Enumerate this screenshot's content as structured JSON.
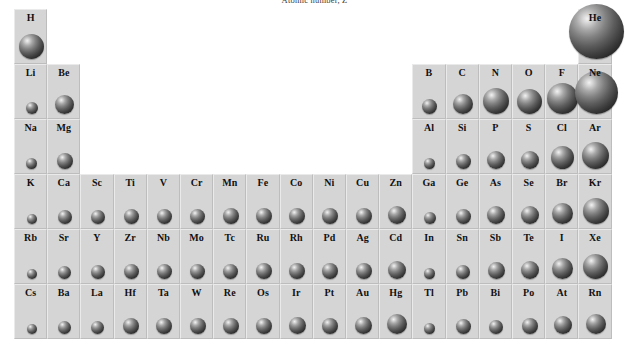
{
  "caption": {
    "text": "Atomic number, Z"
  },
  "colors": {
    "cell_background": "#d5d5d5",
    "cell_border_light": "#eaeaea",
    "cell_border_dark": "#bdbdbd",
    "symbol_text": "#111111",
    "sphere_dark": "#171717",
    "sphere_highlight": "#f2f2f2",
    "page_background": "#ffffff"
  },
  "grid": {
    "groups": 18,
    "periods": 6,
    "cell_width": 33.2,
    "cell_height": 55,
    "origin_x": 0,
    "origin_y": 0
  },
  "chart_data": {
    "type": "table",
    "title": "Atomic number, Z",
    "xlabel": "Group",
    "ylabel": "Period",
    "legend": [],
    "grid_on": true,
    "columns": [
      1,
      2,
      3,
      4,
      5,
      6,
      7,
      8,
      9,
      10,
      11,
      12,
      13,
      14,
      15,
      16,
      17,
      18
    ],
    "rows": [
      "1",
      "2",
      "3",
      "4",
      "5",
      "6"
    ],
    "elements": [
      {
        "symbol": "H",
        "group": 1,
        "period": 1,
        "size": 25
      },
      {
        "symbol": "He",
        "group": 18,
        "period": 1,
        "size": 55
      },
      {
        "symbol": "Li",
        "group": 1,
        "period": 2,
        "size": 12
      },
      {
        "symbol": "Be",
        "group": 2,
        "period": 2,
        "size": 19
      },
      {
        "symbol": "B",
        "group": 13,
        "period": 2,
        "size": 15
      },
      {
        "symbol": "C",
        "group": 14,
        "period": 2,
        "size": 20
      },
      {
        "symbol": "N",
        "group": 15,
        "period": 2,
        "size": 26
      },
      {
        "symbol": "O",
        "group": 16,
        "period": 2,
        "size": 25
      },
      {
        "symbol": "F",
        "group": 17,
        "period": 2,
        "size": 31
      },
      {
        "symbol": "Ne",
        "group": 18,
        "period": 2,
        "size": 43
      },
      {
        "symbol": "Na",
        "group": 1,
        "period": 3,
        "size": 11
      },
      {
        "symbol": "Mg",
        "group": 2,
        "period": 3,
        "size": 16
      },
      {
        "symbol": "Al",
        "group": 13,
        "period": 3,
        "size": 11
      },
      {
        "symbol": "Si",
        "group": 14,
        "period": 3,
        "size": 15
      },
      {
        "symbol": "P",
        "group": 15,
        "period": 3,
        "size": 18
      },
      {
        "symbol": "S",
        "group": 16,
        "period": 3,
        "size": 18
      },
      {
        "symbol": "Cl",
        "group": 17,
        "period": 3,
        "size": 23
      },
      {
        "symbol": "Ar",
        "group": 18,
        "period": 3,
        "size": 27
      },
      {
        "symbol": "K",
        "group": 1,
        "period": 4,
        "size": 10
      },
      {
        "symbol": "Ca",
        "group": 2,
        "period": 4,
        "size": 14
      },
      {
        "symbol": "Sc",
        "group": 3,
        "period": 4,
        "size": 14
      },
      {
        "symbol": "Ti",
        "group": 4,
        "period": 4,
        "size": 15
      },
      {
        "symbol": "V",
        "group": 5,
        "period": 4,
        "size": 15
      },
      {
        "symbol": "Cr",
        "group": 6,
        "period": 4,
        "size": 15
      },
      {
        "symbol": "Mn",
        "group": 7,
        "period": 4,
        "size": 16
      },
      {
        "symbol": "Fe",
        "group": 8,
        "period": 4,
        "size": 16
      },
      {
        "symbol": "Co",
        "group": 9,
        "period": 4,
        "size": 16
      },
      {
        "symbol": "Ni",
        "group": 10,
        "period": 4,
        "size": 16
      },
      {
        "symbol": "Cu",
        "group": 11,
        "period": 4,
        "size": 16
      },
      {
        "symbol": "Zn",
        "group": 12,
        "period": 4,
        "size": 18
      },
      {
        "symbol": "Ga",
        "group": 13,
        "period": 4,
        "size": 12
      },
      {
        "symbol": "Ge",
        "group": 14,
        "period": 4,
        "size": 15
      },
      {
        "symbol": "As",
        "group": 15,
        "period": 4,
        "size": 18
      },
      {
        "symbol": "Se",
        "group": 16,
        "period": 4,
        "size": 18
      },
      {
        "symbol": "Br",
        "group": 17,
        "period": 4,
        "size": 21
      },
      {
        "symbol": "Kr",
        "group": 18,
        "period": 4,
        "size": 26
      },
      {
        "symbol": "Rb",
        "group": 1,
        "period": 5,
        "size": 10
      },
      {
        "symbol": "Sr",
        "group": 2,
        "period": 5,
        "size": 13
      },
      {
        "symbol": "Y",
        "group": 3,
        "period": 5,
        "size": 14
      },
      {
        "symbol": "Zr",
        "group": 4,
        "period": 5,
        "size": 15
      },
      {
        "symbol": "Nb",
        "group": 5,
        "period": 5,
        "size": 15
      },
      {
        "symbol": "Mo",
        "group": 6,
        "period": 5,
        "size": 15
      },
      {
        "symbol": "Tc",
        "group": 7,
        "period": 5,
        "size": 15
      },
      {
        "symbol": "Ru",
        "group": 8,
        "period": 5,
        "size": 16
      },
      {
        "symbol": "Rh",
        "group": 9,
        "period": 5,
        "size": 16
      },
      {
        "symbol": "Pd",
        "group": 10,
        "period": 5,
        "size": 16
      },
      {
        "symbol": "Ag",
        "group": 11,
        "period": 5,
        "size": 16
      },
      {
        "symbol": "Cd",
        "group": 12,
        "period": 5,
        "size": 18
      },
      {
        "symbol": "In",
        "group": 13,
        "period": 5,
        "size": 11
      },
      {
        "symbol": "Sn",
        "group": 14,
        "period": 5,
        "size": 14
      },
      {
        "symbol": "Sb",
        "group": 15,
        "period": 5,
        "size": 17
      },
      {
        "symbol": "Te",
        "group": 16,
        "period": 5,
        "size": 18
      },
      {
        "symbol": "I",
        "group": 17,
        "period": 5,
        "size": 21
      },
      {
        "symbol": "Xe",
        "group": 18,
        "period": 5,
        "size": 25
      },
      {
        "symbol": "Cs",
        "group": 1,
        "period": 6,
        "size": 10
      },
      {
        "symbol": "Ba",
        "group": 2,
        "period": 6,
        "size": 13
      },
      {
        "symbol": "La",
        "group": 3,
        "period": 6,
        "size": 13
      },
      {
        "symbol": "Hf",
        "group": 4,
        "period": 6,
        "size": 16
      },
      {
        "symbol": "Ta",
        "group": 5,
        "period": 6,
        "size": 16
      },
      {
        "symbol": "W",
        "group": 6,
        "period": 6,
        "size": 16
      },
      {
        "symbol": "Re",
        "group": 7,
        "period": 6,
        "size": 16
      },
      {
        "symbol": "Os",
        "group": 8,
        "period": 6,
        "size": 16
      },
      {
        "symbol": "Ir",
        "group": 9,
        "period": 6,
        "size": 17
      },
      {
        "symbol": "Pt",
        "group": 10,
        "period": 6,
        "size": 16
      },
      {
        "symbol": "Au",
        "group": 11,
        "period": 6,
        "size": 17
      },
      {
        "symbol": "Hg",
        "group": 12,
        "period": 6,
        "size": 20
      },
      {
        "symbol": "Tl",
        "group": 13,
        "period": 6,
        "size": 11
      },
      {
        "symbol": "Pb",
        "group": 14,
        "period": 6,
        "size": 15
      },
      {
        "symbol": "Bi",
        "group": 15,
        "period": 6,
        "size": 14
      },
      {
        "symbol": "Po",
        "group": 16,
        "period": 6,
        "size": 16
      },
      {
        "symbol": "At",
        "group": 17,
        "period": 6,
        "size": 18
      },
      {
        "symbol": "Rn",
        "group": 18,
        "period": 6,
        "size": 20
      }
    ]
  }
}
